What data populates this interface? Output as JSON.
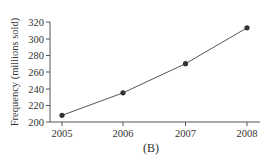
{
  "chart_data": {
    "type": "line",
    "title": "",
    "caption": "(B)",
    "xlabel": "",
    "ylabel": "Frequency (millions sold)",
    "categories": [
      "2005",
      "2006",
      "2007",
      "2008"
    ],
    "values": [
      208,
      235,
      270,
      313
    ],
    "ylim": [
      200,
      320
    ],
    "yticks": [
      "200",
      "220",
      "240",
      "260",
      "280",
      "300",
      "320"
    ],
    "xticks": [
      "2005",
      "2006",
      "2007",
      "2008"
    ],
    "grid": false,
    "legend": null,
    "markers": true,
    "colors": {
      "line": "#555555",
      "marker": "#333333",
      "axis": "#555555",
      "text": "#333333"
    }
  }
}
